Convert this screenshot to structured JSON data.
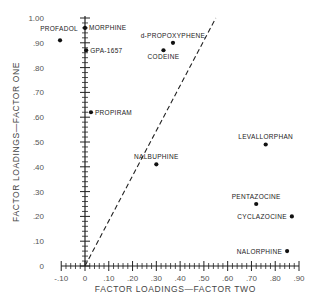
{
  "chart_data": {
    "type": "scatter",
    "title": "",
    "xlabel": "FACTOR LOADINGS—FACTOR TWO",
    "ylabel": "FACTOR LOADINGS—FACTOR ONE",
    "xlim": [
      -0.1,
      0.9
    ],
    "ylim": [
      0,
      1.0
    ],
    "x_ticks": [
      -0.1,
      0,
      0.1,
      0.2,
      0.3,
      0.4,
      0.5,
      0.6,
      0.7,
      0.8,
      0.9
    ],
    "x_tick_labels": [
      "-.10",
      "0",
      ".10",
      ".20",
      ".30",
      ".40",
      ".50",
      ".60",
      ".70",
      ".80",
      ".90"
    ],
    "y_ticks": [
      0,
      0.1,
      0.2,
      0.3,
      0.4,
      0.5,
      0.6,
      0.7,
      0.8,
      0.9,
      1.0
    ],
    "y_tick_labels": [
      "0",
      ".10",
      ".20",
      ".30",
      ".40",
      ".50",
      ".60",
      ".70",
      ".80",
      ".90",
      "1.00"
    ],
    "grid": false,
    "points": [
      {
        "label": "PROFADOL",
        "x": -0.105,
        "y": 0.91,
        "label_pos": "above-left"
      },
      {
        "label": "MORPHINE",
        "x": 0.0,
        "y": 0.96,
        "label_pos": "right"
      },
      {
        "label": "GPA-1657",
        "x": 0.005,
        "y": 0.87,
        "label_pos": "right"
      },
      {
        "label": "PROPIRAM",
        "x": 0.025,
        "y": 0.62,
        "label_pos": "right"
      },
      {
        "label": "d-PROPOXYPHENE",
        "x": 0.37,
        "y": 0.9,
        "label_pos": "above"
      },
      {
        "label": "CODEINE",
        "x": 0.33,
        "y": 0.87,
        "label_pos": "below"
      },
      {
        "label": "NALBUPHINE",
        "x": 0.3,
        "y": 0.41,
        "label_pos": "above"
      },
      {
        "label": "LEVALLORPHAN",
        "x": 0.76,
        "y": 0.49,
        "label_pos": "above"
      },
      {
        "label": "PENTAZOCINE",
        "x": 0.72,
        "y": 0.25,
        "label_pos": "above"
      },
      {
        "label": "CYCLAZOCINE",
        "x": 0.87,
        "y": 0.2,
        "label_pos": "left"
      },
      {
        "label": "NALORPHINE",
        "x": 0.85,
        "y": 0.06,
        "label_pos": "left"
      }
    ],
    "reference_line": {
      "style": "dashed",
      "from": [
        0,
        0
      ],
      "to": [
        0.55,
        1.0
      ]
    }
  }
}
